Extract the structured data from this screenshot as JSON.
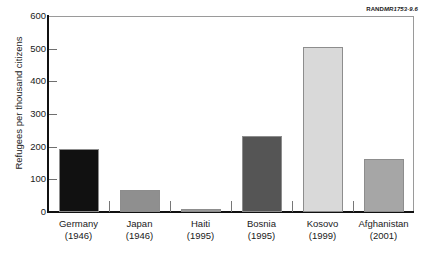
{
  "credit": {
    "rand": "RAND",
    "doc_id": "MR1753-9.6"
  },
  "chart_data": {
    "type": "bar",
    "title": "",
    "xlabel": "",
    "ylabel": "Refugees per thousand citizens",
    "ylim": [
      0,
      600
    ],
    "yticks": [
      0,
      100,
      200,
      300,
      400,
      500,
      600
    ],
    "ytick_labels": [
      "0",
      "100",
      "200",
      "300",
      "400",
      "500",
      "600"
    ],
    "grid": false,
    "legend": "none",
    "categories": [
      "Germany",
      "Japan",
      "Haiti",
      "Bosnia",
      "Kosovo",
      "Afghanistan"
    ],
    "category_years": [
      "(1946)",
      "(1946)",
      "(1995)",
      "(1995)",
      "(1999)",
      "(2001)"
    ],
    "values": [
      192,
      68,
      8,
      233,
      505,
      161
    ],
    "bar_colors": [
      "#111111",
      "#8f8f8f",
      "#9a9a9a",
      "#555555",
      "#d9d9d9",
      "#a6a6a6"
    ],
    "bars": [
      {
        "category": "Germany",
        "year": "(1946)",
        "value": 192,
        "color": "#111111"
      },
      {
        "category": "Japan",
        "year": "(1946)",
        "value": 68,
        "color": "#8f8f8f"
      },
      {
        "category": "Haiti",
        "year": "(1995)",
        "value": 8,
        "color": "#9a9a9a"
      },
      {
        "category": "Bosnia",
        "year": "(1995)",
        "value": 233,
        "color": "#555555"
      },
      {
        "category": "Kosovo",
        "year": "(1999)",
        "value": 505,
        "color": "#d9d9d9"
      },
      {
        "category": "Afghanistan",
        "year": "(2001)",
        "value": 161,
        "color": "#a6a6a6"
      }
    ]
  }
}
